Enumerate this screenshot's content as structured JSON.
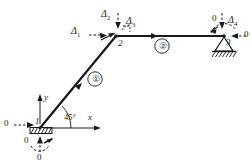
{
  "figure": {
    "kind": "structural-frame-dof-diagram",
    "ink_color": "#1a1a1a",
    "background": "#ffffff"
  },
  "nodes": [
    {
      "id": "1",
      "label": "1",
      "x": 40,
      "y": 128,
      "support": "sliding-fixed-hatched"
    },
    {
      "id": "2",
      "label": "2",
      "x": 116,
      "y": 36,
      "support": "free"
    },
    {
      "id": "3",
      "label": "3",
      "x": 224,
      "y": 36,
      "support": "pinned-triangle-hatched"
    }
  ],
  "members": [
    {
      "id": "1",
      "label": "①",
      "from": "1",
      "to": "2",
      "kind": "diagonal"
    },
    {
      "id": "2",
      "label": "②",
      "from": "2",
      "to": "3",
      "kind": "horizontal"
    }
  ],
  "dof_labels": {
    "node1": {
      "horizontal": "0",
      "vertical": "0",
      "rotation": "0"
    },
    "node2": {
      "horizontal": "Δ1",
      "horizontal_base": "Δ",
      "horizontal_sub": "1",
      "vertical_base": "Δ",
      "vertical_sub": "2",
      "rotation_base": "Δ",
      "rotation_sub": "3"
    },
    "node3": {
      "vertical": "0",
      "rotation_base": "Δ",
      "rotation_sub": "4",
      "horizontal": "0"
    }
  },
  "axes": {
    "x_label": "x",
    "y_label": "y",
    "angle_label": "45°"
  }
}
